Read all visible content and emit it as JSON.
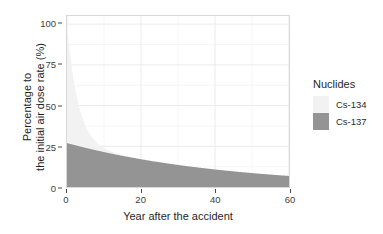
{
  "chart_data": {
    "type": "area",
    "stacked": true,
    "title": "",
    "xlabel": "Year after the accident",
    "ylabel": "Percentage to\nthe initial air dose rate (%)",
    "ylabel_line1": "Percentage to",
    "ylabel_line2": "the initial air dose rate (%)",
    "xlim": [
      0,
      60
    ],
    "ylim": [
      0,
      105
    ],
    "xticks": [
      0,
      20,
      40,
      60
    ],
    "xtick_labels": [
      "0",
      "20",
      "40",
      "60"
    ],
    "yticks": [
      0,
      25,
      50,
      75,
      100
    ],
    "ytick_labels": [
      "0",
      "25",
      "50",
      "75",
      "100"
    ],
    "grid": true,
    "grid_color": "#ebebeb",
    "legend": {
      "position": "right",
      "title": "Nuclides",
      "entries": [
        {
          "name": "Cs-134",
          "color": "#f2f2f2"
        },
        {
          "name": "Cs-137",
          "color": "#949494"
        }
      ]
    },
    "x": [
      0,
      1,
      2,
      3,
      4,
      5,
      6,
      7,
      8,
      9,
      10,
      12,
      14,
      16,
      18,
      20,
      25,
      30,
      35,
      40,
      45,
      50,
      55,
      60
    ],
    "series": [
      {
        "name": "Cs-134",
        "color": "#f2f2f2",
        "half_life_years": 2.06,
        "initial_percent": 73,
        "values": [
          73.0,
          51.6,
          36.5,
          25.8,
          18.2,
          12.9,
          9.1,
          6.4,
          4.6,
          3.2,
          2.3,
          1.1,
          0.6,
          0.3,
          0.14,
          0.07,
          0.016,
          0.003,
          0.001,
          0.0,
          0.0,
          0.0,
          0.0,
          0.0
        ]
      },
      {
        "name": "Cs-137",
        "color": "#949494",
        "half_life_years": 30.17,
        "initial_percent": 27,
        "values": [
          27.0,
          26.4,
          25.8,
          25.2,
          24.6,
          24.1,
          23.5,
          23.0,
          22.4,
          21.9,
          21.4,
          20.5,
          19.5,
          18.6,
          17.8,
          17.0,
          15.1,
          13.5,
          12.0,
          10.7,
          9.6,
          8.5,
          7.6,
          6.8
        ]
      }
    ],
    "totals": [
      100.0,
      78.0,
      62.3,
      51.0,
      42.8,
      37.0,
      32.6,
      29.4,
      27.0,
      25.1,
      23.7,
      21.6,
      20.1,
      18.9,
      17.9,
      17.1,
      15.1,
      13.5,
      12.0,
      10.7,
      9.6,
      8.5,
      7.6,
      6.8
    ]
  },
  "panel": {
    "background": "#ffffff",
    "border_color": "#d8d8d8"
  }
}
